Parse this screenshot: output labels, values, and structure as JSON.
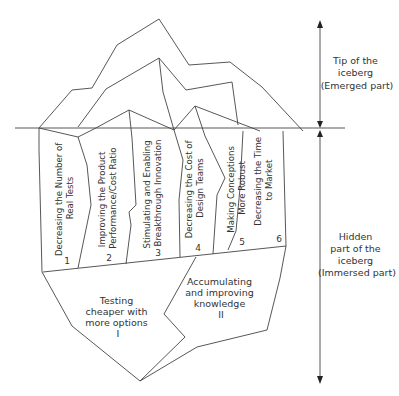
{
  "diagram": {
    "type": "iceberg",
    "colors": {
      "line": "#444444",
      "text": "#333333",
      "background": "#ffffff"
    },
    "side_labels": {
      "tip": [
        "Tip of the",
        "iceberg",
        "(Emerged part)"
      ],
      "hidden": [
        "Hidden",
        "part of the",
        "iceberg",
        "(Immersed part)"
      ]
    },
    "panels": [
      {
        "number": "1",
        "lines": [
          "Decreasing the Number of",
          "Real Tests"
        ]
      },
      {
        "number": "2",
        "lines": [
          "Improving the Product",
          "Performance/Cost Ratio"
        ]
      },
      {
        "number": "3",
        "lines": [
          "Stimulating and Enabling",
          "Breakthrough Innovation"
        ]
      },
      {
        "number": "4",
        "lines": [
          "Decreasing the Cost of",
          "Design Teams"
        ]
      },
      {
        "number": "5",
        "lines": [
          "Making Conceptions",
          "More Robust"
        ]
      },
      {
        "number": "6",
        "lines": [
          "Decreasing the Time",
          "to Market"
        ]
      }
    ],
    "base_sections": [
      {
        "numeral": "I",
        "lines": [
          "Testing",
          "cheaper with",
          "more options"
        ]
      },
      {
        "numeral": "II",
        "lines": [
          "Accumulating",
          "and improving",
          "knowledge"
        ]
      }
    ]
  }
}
